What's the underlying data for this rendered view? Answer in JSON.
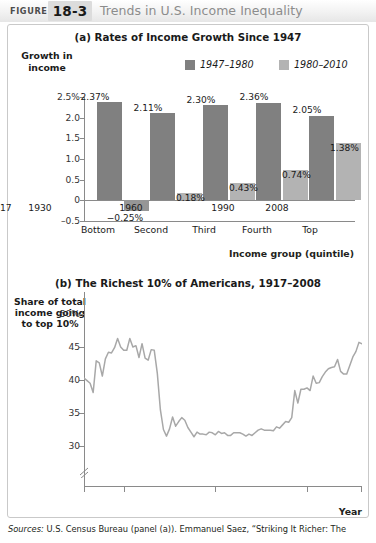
{
  "figure": {
    "label": "FIGURE",
    "number": "18-3",
    "title": "Trends in U.S. Income Inequality"
  },
  "panel_a": {
    "title": "(a) Rates of Income Growth Since 1947",
    "ylabel": "Growth in income",
    "xlabel": "Income group (quintile)",
    "legend": [
      {
        "label": "1947–1980",
        "color": "#808080"
      },
      {
        "label": "1980–2010",
        "color": "#b3b3b3"
      }
    ],
    "ytick_labels": [
      "2.5%",
      "2.0",
      "1.5",
      "1.0",
      "0.5",
      "0",
      "–0.5"
    ],
    "xtick_labels": [
      "Bottom",
      "Second",
      "Third",
      "Fourth",
      "Top"
    ],
    "bar_labels_1947": [
      "2.37%",
      "2.11%",
      "2.30%",
      "2.36%",
      "2.05%"
    ],
    "bar_labels_1980": [
      "−0.25%",
      "0.18%",
      "0.43%",
      "0.74%",
      "1.38%"
    ]
  },
  "panel_b": {
    "title": "(b) The Richest 10% of Americans, 1917–2008",
    "ylabel": "Share of total income going to top 10%",
    "xlabel": "Year",
    "ytick_labels": [
      "50%",
      "45",
      "40",
      "35",
      "30"
    ],
    "xtick_labels": [
      "1917",
      "1930",
      "1960",
      "1990",
      "2008"
    ]
  },
  "sources": {
    "prefix": "Sources:",
    "text": " U.S. Census Bureau (panel (a)). Emmanuel Saez, “Striking It Richer: The"
  },
  "chart_data": [
    {
      "type": "bar",
      "title": "(a) Rates of Income Growth Since 1947",
      "xlabel": "Income group (quintile)",
      "ylabel": "Growth in income",
      "categories": [
        "Bottom",
        "Second",
        "Third",
        "Fourth",
        "Top"
      ],
      "ylim": [
        -0.5,
        2.5
      ],
      "yticks": [
        -0.5,
        0,
        0.5,
        1.0,
        1.5,
        2.0,
        2.5
      ],
      "grid": false,
      "legend_position": "top-right",
      "series": [
        {
          "name": "1947–1980",
          "color": "#808080",
          "values": [
            2.37,
            2.11,
            2.3,
            2.36,
            2.05
          ]
        },
        {
          "name": "1980–2010",
          "color": "#b3b3b3",
          "values": [
            -0.25,
            0.18,
            0.43,
            0.74,
            1.38
          ]
        }
      ]
    },
    {
      "type": "line",
      "title": "(b) The Richest 10% of Americans, 1917–2008",
      "xlabel": "Year",
      "ylabel": "Share of total income going to top 10%",
      "xlim": [
        1917,
        2008
      ],
      "ylim": [
        29,
        50
      ],
      "yticks": [
        30,
        35,
        40,
        45,
        50
      ],
      "xticks": [
        1917,
        1930,
        1960,
        1990,
        2008
      ],
      "axis_break_y": true,
      "grid": false,
      "color": "#a8a8a8",
      "x": [
        1917,
        1918,
        1919,
        1920,
        1921,
        1922,
        1923,
        1924,
        1925,
        1926,
        1927,
        1928,
        1929,
        1930,
        1931,
        1932,
        1933,
        1934,
        1935,
        1936,
        1937,
        1938,
        1939,
        1940,
        1941,
        1942,
        1943,
        1944,
        1945,
        1946,
        1947,
        1948,
        1949,
        1950,
        1951,
        1952,
        1953,
        1954,
        1955,
        1956,
        1957,
        1958,
        1959,
        1960,
        1961,
        1962,
        1963,
        1964,
        1965,
        1966,
        1967,
        1968,
        1969,
        1970,
        1971,
        1972,
        1973,
        1974,
        1975,
        1976,
        1977,
        1978,
        1979,
        1980,
        1981,
        1982,
        1983,
        1984,
        1985,
        1986,
        1987,
        1988,
        1989,
        1990,
        1991,
        1992,
        1993,
        1994,
        1995,
        1996,
        1997,
        1998,
        1999,
        2000,
        2001,
        2002,
        2003,
        2004,
        2005,
        2006,
        2007,
        2008
      ],
      "y": [
        40.3,
        39.9,
        39.5,
        38.1,
        42.9,
        42.6,
        40.6,
        43.2,
        44.2,
        44.1,
        44.9,
        46.3,
        45.0,
        44.5,
        44.5,
        46.3,
        45.0,
        45.2,
        43.4,
        45.5,
        43.3,
        43.0,
        44.6,
        44.5,
        41.0,
        35.5,
        32.5,
        31.5,
        32.6,
        34.4,
        33.0,
        33.7,
        34.3,
        33.9,
        32.8,
        32.1,
        31.4,
        32.1,
        31.8,
        31.8,
        31.7,
        32.1,
        32.0,
        31.7,
        32.2,
        31.9,
        32.0,
        31.6,
        31.6,
        32.0,
        32.0,
        32.0,
        31.8,
        31.5,
        31.8,
        31.6,
        32.0,
        32.4,
        32.6,
        32.4,
        32.4,
        32.4,
        32.3,
        32.9,
        32.7,
        33.2,
        33.7,
        33.6,
        34.3,
        38.4,
        36.5,
        38.6,
        38.6,
        38.8,
        38.4,
        40.6,
        39.5,
        39.6,
        40.5,
        41.2,
        41.7,
        41.9,
        42.0,
        43.1,
        41.3,
        40.9,
        40.9,
        42.2,
        43.5,
        44.3,
        45.7,
        45.5
      ]
    }
  ]
}
